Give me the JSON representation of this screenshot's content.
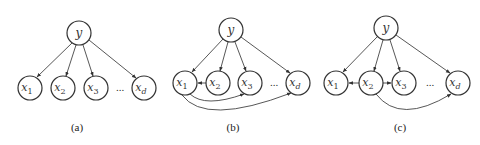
{
  "figure": {
    "panels": [
      {
        "caption": "(a)",
        "root": {
          "label": "y",
          "cx": 79,
          "cy": 33
        },
        "children": [
          {
            "label": "x",
            "sub": "1",
            "cx": 30,
            "cy": 88
          },
          {
            "label": "x",
            "sub": "2",
            "cx": 63,
            "cy": 88
          },
          {
            "label": "x",
            "sub": "3",
            "cx": 96,
            "cy": 88
          },
          {
            "label": "x",
            "sub": "d",
            "cx": 144,
            "cy": 88
          }
        ],
        "ellipsis": "...",
        "extra_edges": []
      },
      {
        "caption": "(b)",
        "root": {
          "label": "y",
          "cx": 231,
          "cy": 30
        },
        "children": [
          {
            "label": "x",
            "sub": "1",
            "cx": 185,
            "cy": 83
          },
          {
            "label": "x",
            "sub": "2",
            "cx": 218,
            "cy": 83
          },
          {
            "label": "x",
            "sub": "3",
            "cx": 250,
            "cy": 83
          },
          {
            "label": "x",
            "sub": "d",
            "cx": 298,
            "cy": 83
          }
        ],
        "ellipsis": "...",
        "extra_edges": [
          {
            "from": "x2",
            "to": "x1",
            "type": "straight"
          },
          {
            "from": "x1",
            "to": "x3",
            "type": "curve"
          },
          {
            "from": "x1",
            "to": "xd",
            "type": "curve"
          }
        ]
      },
      {
        "caption": "(c)",
        "root": {
          "label": "y",
          "cx": 386,
          "cy": 28
        },
        "children": [
          {
            "label": "x",
            "sub": "1",
            "cx": 336,
            "cy": 83
          },
          {
            "label": "x",
            "sub": "2",
            "cx": 371,
            "cy": 83
          },
          {
            "label": "x",
            "sub": "3",
            "cx": 404,
            "cy": 83
          },
          {
            "label": "x",
            "sub": "d",
            "cx": 458,
            "cy": 83
          }
        ],
        "ellipsis": "...",
        "extra_edges": [
          {
            "from": "x2",
            "to": "x1",
            "type": "straight"
          },
          {
            "from": "x2",
            "to": "x3",
            "type": "straight"
          },
          {
            "from": "x2",
            "to": "xd",
            "type": "curve"
          }
        ]
      }
    ],
    "colors": {
      "stroke": "#333333",
      "background": "#ffffff"
    }
  }
}
